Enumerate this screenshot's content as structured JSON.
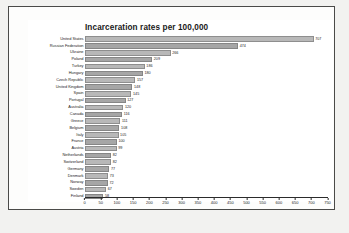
{
  "chart_data": {
    "type": "bar",
    "orientation": "horizontal",
    "title": "Incarceration rates per 100,000",
    "xlabel": "",
    "ylabel": "",
    "xlim": [
      0,
      750
    ],
    "grid": false,
    "legend": null,
    "xticks": [
      0,
      50,
      100,
      150,
      200,
      250,
      300,
      350,
      400,
      450,
      500,
      550,
      600,
      650,
      700,
      750
    ],
    "xtick_labels": [
      "0",
      "50",
      "100",
      "150",
      "200",
      "250",
      "300",
      "350",
      "400",
      "450",
      "500",
      "550",
      "600",
      "650",
      "700",
      "750"
    ],
    "categories": [
      "United States",
      "Russian Federation",
      "Ukraine",
      "Poland",
      "Turkey",
      "Hungary",
      "Czech Republic",
      "United Kingdom",
      "Spain",
      "Portugal",
      "Australia",
      "Canada",
      "Greece",
      "Belgium",
      "Italy",
      "France",
      "Austria",
      "Netherlands",
      "Switzerland",
      "Germany",
      "Denmark",
      "Norway",
      "Sweden",
      "Finland"
    ],
    "values": [
      707,
      474,
      266,
      209,
      186,
      180,
      157,
      148,
      145,
      127,
      120,
      116,
      111,
      108,
      105,
      100,
      99,
      82,
      82,
      77,
      73,
      72,
      67,
      58
    ],
    "value_labels": [
      "707",
      "474",
      "266",
      "209",
      "186",
      "180",
      "157",
      "148",
      "145",
      "127",
      "120",
      "116",
      "111",
      "108",
      "105",
      "100",
      "99",
      "82",
      "82",
      "77",
      "73",
      "72",
      "67",
      "58"
    ],
    "colors": {
      "bar_fill": "#b8b8b8",
      "bar_fill_alt": "#a6a6a6",
      "bar_stroke": "#8e8e8e",
      "axis": "#2b2b2b",
      "text": "#1c1c1c",
      "panel_background": "#ffffff",
      "page_background": "#f2f2f0",
      "frame_border": "#4a4a48"
    }
  }
}
